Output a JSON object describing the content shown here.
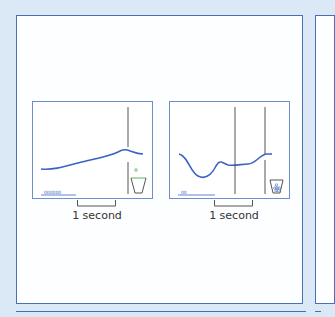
{
  "figure": {
    "panels": [
      {
        "id": "left",
        "trace": "rising",
        "scale_label": "1 second",
        "marker_label": "000000",
        "cup_state": "empty-with-ball-above"
      },
      {
        "id": "right",
        "trace": "dip-then-rise",
        "scale_label": "1 second",
        "marker_label": "00",
        "cup_state": "filled"
      }
    ],
    "colors": {
      "background": "#dbe8f5",
      "frame": "#4a6fb5",
      "trace": "#3a62c4",
      "line": "#555555",
      "cup_rim": "#5fb35f"
    }
  }
}
